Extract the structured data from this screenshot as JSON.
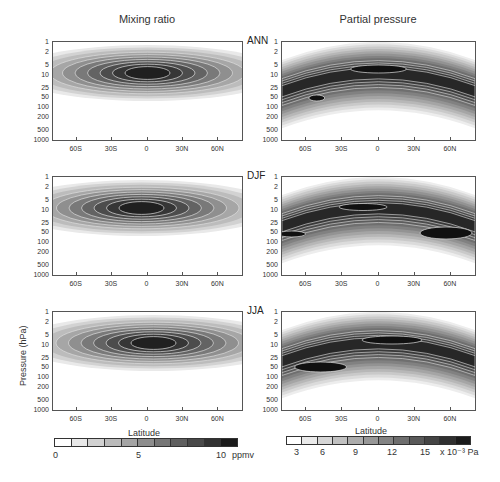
{
  "chart_data": {
    "type": "heatmap",
    "column_titles": [
      "Mixing ratio",
      "Partial pressure"
    ],
    "row_labels": [
      "ANN",
      "DJF",
      "JJA"
    ],
    "xlabel": "Latitude",
    "ylabel": "Pressure (hPa)",
    "x_ticks": [
      "60S",
      "30S",
      "0",
      "30N",
      "60N"
    ],
    "y_ticks": [
      "1",
      "2",
      "5",
      "10",
      "25",
      "50",
      "100",
      "200",
      "500",
      "1000"
    ],
    "y_scale": "log",
    "ylim": [
      1000,
      1
    ],
    "xlim": [
      -80,
      80
    ],
    "colorbars": [
      {
        "panel_column": "Mixing ratio",
        "ticks": [
          "0",
          "5",
          "10"
        ],
        "unit": "ppmv",
        "range": [
          0,
          11
        ],
        "levels": 11
      },
      {
        "panel_column": "Partial pressure",
        "ticks": [
          "3",
          "6",
          "9",
          "12",
          "15"
        ],
        "unit": "x 10⁻³ Pa",
        "range": [
          0,
          18
        ],
        "levels": 12
      }
    ],
    "panels": [
      {
        "season": "ANN",
        "field": "Mixing ratio",
        "peak_value_approx": 10.5,
        "peak_location": {
          "lat": 0,
          "pressure_hPa": 10
        },
        "notes": "broad maximum 2-25 hPa, extends pole to pole"
      },
      {
        "season": "ANN",
        "field": "Partial pressure",
        "peak_value_approx": 17,
        "peak_location": {
          "lat": -5,
          "pressure_hPa": 20
        },
        "notes": "arched band ~25 hPa at equator, ~50-70 hPa at poles"
      },
      {
        "season": "DJF",
        "field": "Mixing ratio",
        "peak_value_approx": 10.5,
        "peak_location": {
          "lat": -5,
          "pressure_hPa": 8
        },
        "notes": "maximum shifted slightly south"
      },
      {
        "season": "DJF",
        "field": "Partial pressure",
        "peak_value_approx": 17,
        "peak_location": {
          "lat": 50,
          "pressure_hPa": 45
        },
        "notes": "arched band with NH high-latitude maximum"
      },
      {
        "season": "JJA",
        "field": "Mixing ratio",
        "peak_value_approx": 10.5,
        "peak_location": {
          "lat": 5,
          "pressure_hPa": 8
        },
        "notes": "maximum shifted slightly north"
      },
      {
        "season": "JJA",
        "field": "Partial pressure",
        "peak_value_approx": 17,
        "peak_location": {
          "lat": 10,
          "pressure_hPa": 22
        },
        "notes": "arched band, max near equator to 40N"
      }
    ]
  },
  "titles": {
    "left": "Mixing ratio",
    "right": "Partial pressure"
  },
  "seasons": [
    "ANN",
    "DJF",
    "JJA"
  ],
  "axes": {
    "xlabel": "Latitude",
    "ylabel": "Pressure (hPa)",
    "yticks": [
      "1",
      "2",
      "5",
      "10",
      "25",
      "50",
      "100",
      "200",
      "500",
      "1000"
    ],
    "xticks": [
      "60S",
      "30S",
      "0",
      "30N",
      "60N"
    ]
  },
  "colorbar_left": {
    "ticks": [
      "0",
      "5",
      "10"
    ],
    "unit": "ppmv"
  },
  "colorbar_right": {
    "ticks": [
      "3",
      "6",
      "9",
      "12",
      "15"
    ],
    "unit": "x 10⁻³ Pa"
  }
}
